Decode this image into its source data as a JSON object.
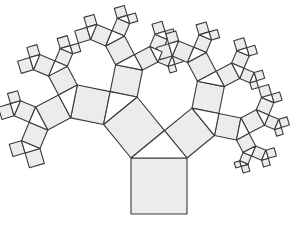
{
  "diagram": {
    "type": "pythagoras-tree",
    "width": 290,
    "height": 231,
    "base_square": {
      "left": 131,
      "top": 158,
      "size": 56
    },
    "apex_angle_deg": 39.3,
    "levels": 6,
    "colors": {
      "square_fill": "#ececec",
      "triangle_fill": "#ffffff",
      "stroke": "#3a3a3a",
      "background": "#ffffff"
    }
  }
}
